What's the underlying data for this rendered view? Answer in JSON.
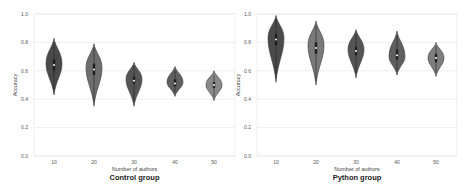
{
  "chart_data": [
    {
      "type": "violin",
      "title": "Control group",
      "xlabel": "Number of authors",
      "ylabel": "Accuracy",
      "ylim": [
        0.0,
        1.0
      ],
      "yticks": [
        "0.0",
        "0.2",
        "0.4",
        "0.6",
        "0.8",
        "1.0"
      ],
      "categories": [
        "10",
        "20",
        "30",
        "40",
        "50"
      ],
      "grid": true,
      "legend": null,
      "series": [
        {
          "category": "10",
          "min": 0.43,
          "max": 0.83,
          "median": 0.64,
          "q1": 0.6,
          "q3": 0.68,
          "mode": 0.65,
          "color": "#4a4a4a"
        },
        {
          "category": "20",
          "min": 0.35,
          "max": 0.79,
          "median": 0.61,
          "q1": 0.57,
          "q3": 0.65,
          "mode": 0.62,
          "color": "#6e6e6e"
        },
        {
          "category": "30",
          "min": 0.35,
          "max": 0.66,
          "median": 0.53,
          "q1": 0.51,
          "q3": 0.56,
          "mode": 0.54,
          "color": "#555555"
        },
        {
          "category": "40",
          "min": 0.42,
          "max": 0.63,
          "median": 0.51,
          "q1": 0.49,
          "q3": 0.54,
          "mode": 0.52,
          "color": "#5f5f5f"
        },
        {
          "category": "50",
          "min": 0.39,
          "max": 0.6,
          "median": 0.5,
          "q1": 0.48,
          "q3": 0.52,
          "mode": 0.5,
          "color": "#8a8a8a"
        }
      ]
    },
    {
      "type": "violin",
      "title": "Python group",
      "xlabel": "Number of authors",
      "ylabel": "Accuracy",
      "ylim": [
        0.0,
        1.0
      ],
      "yticks": [
        "0.0",
        "0.2",
        "0.4",
        "0.6",
        "0.8",
        "1.0"
      ],
      "categories": [
        "10",
        "20",
        "30",
        "40",
        "50"
      ],
      "grid": true,
      "legend": null,
      "series": [
        {
          "category": "10",
          "min": 0.52,
          "max": 0.99,
          "median": 0.82,
          "q1": 0.78,
          "q3": 0.86,
          "mode": 0.83,
          "color": "#4a4a4a"
        },
        {
          "category": "20",
          "min": 0.5,
          "max": 0.95,
          "median": 0.76,
          "q1": 0.72,
          "q3": 0.8,
          "mode": 0.78,
          "color": "#7a7a7a"
        },
        {
          "category": "30",
          "min": 0.55,
          "max": 0.89,
          "median": 0.74,
          "q1": 0.71,
          "q3": 0.77,
          "mode": 0.75,
          "color": "#555555"
        },
        {
          "category": "40",
          "min": 0.57,
          "max": 0.88,
          "median": 0.71,
          "q1": 0.68,
          "q3": 0.75,
          "mode": 0.7,
          "color": "#5f5f5f"
        },
        {
          "category": "50",
          "min": 0.56,
          "max": 0.8,
          "median": 0.69,
          "q1": 0.66,
          "q3": 0.72,
          "mode": 0.69,
          "color": "#7e7e7e"
        }
      ]
    }
  ],
  "panels": [
    {
      "title": "Control group",
      "xlabel": "Number of authors",
      "ylabel": "Accuracy"
    },
    {
      "title": "Python group",
      "xlabel": "Number of authors",
      "ylabel": "Accuracy"
    }
  ]
}
